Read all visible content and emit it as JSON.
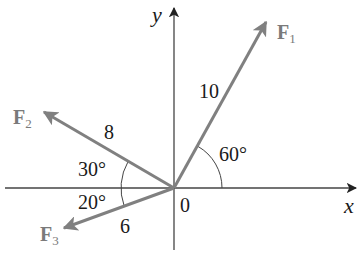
{
  "diagram": {
    "type": "force-vectors",
    "colors": {
      "axis": "#333333",
      "vector": "#808080",
      "arc": "#444444",
      "label_text": "#1a1a1a",
      "force_label": "#7a7a7a"
    },
    "axes": {
      "x_label": "x",
      "y_label": "y",
      "origin_label": "0"
    },
    "vectors": [
      {
        "id": "F1",
        "label": "F",
        "subscript": "1",
        "magnitude": "10",
        "angle_label": "60°",
        "angle_reference": "measured from positive x-axis",
        "direction_deg": 60
      },
      {
        "id": "F2",
        "label": "F",
        "subscript": "2",
        "magnitude": "8",
        "angle_label": "30°",
        "angle_reference": "measured above negative x-axis",
        "direction_deg": 150
      },
      {
        "id": "F3",
        "label": "F",
        "subscript": "3",
        "magnitude": "6",
        "angle_label": "20°",
        "angle_reference": "measured below negative x-axis",
        "direction_deg": 200
      }
    ]
  }
}
